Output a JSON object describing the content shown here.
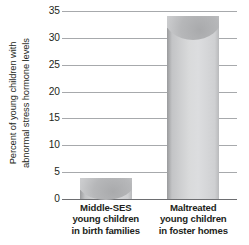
{
  "chart_data": {
    "type": "bar",
    "title": "",
    "xlabel": "",
    "ylabel_lines": [
      "Percent of young children with",
      "abnormal stress hormone levels"
    ],
    "ylabel": "Percent of young children with abnormal stress hormone levels",
    "categories": [
      "Middle-SES young children in birth families",
      "Maltreated young children in foster homes"
    ],
    "category_lines": [
      [
        "Middle-SES",
        "young children",
        "in birth families"
      ],
      [
        "Maltreated",
        "young children",
        "in foster homes"
      ]
    ],
    "values": [
      4,
      34
    ],
    "ylim": [
      0,
      35
    ],
    "ytick_values": [
      0,
      5,
      10,
      15,
      20,
      25,
      30,
      35
    ],
    "ytick_labels": [
      "0",
      "5",
      "10",
      "15",
      "20",
      "25",
      "30",
      "35"
    ],
    "grid": true,
    "legend": false,
    "bar_color": "#dcdddf",
    "grid_color": "#a7a9ac",
    "axis_color": "#6d6e71",
    "text_color": "#231f20"
  }
}
